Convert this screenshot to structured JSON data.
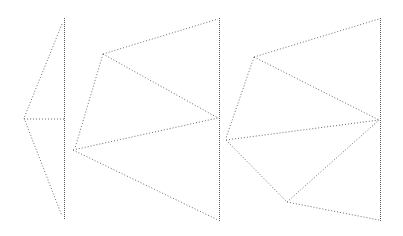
{
  "diagram": {
    "type": "dotted-line-geometric-figure",
    "stroke_color": "#6b6b6b",
    "background": "#ffffff",
    "vertical_lines": [
      {
        "id": "v1",
        "x": 64,
        "y1": 18,
        "y2": 220
      },
      {
        "id": "v2",
        "x": 219,
        "y1": 18,
        "y2": 222
      },
      {
        "id": "v3",
        "x": 380,
        "y1": 18,
        "y2": 222
      }
    ],
    "segments": [
      {
        "id": "s1",
        "x1": 62,
        "y1": 24,
        "x2": 24,
        "y2": 118
      },
      {
        "id": "s2",
        "x1": 24,
        "y1": 118,
        "x2": 62,
        "y2": 216
      },
      {
        "id": "s3",
        "x1": 24,
        "y1": 119,
        "x2": 64,
        "y2": 119
      },
      {
        "id": "s4",
        "x1": 103,
        "y1": 54,
        "x2": 218,
        "y2": 19
      },
      {
        "id": "s5",
        "x1": 103,
        "y1": 54,
        "x2": 218,
        "y2": 118
      },
      {
        "id": "s6",
        "x1": 103,
        "y1": 54,
        "x2": 75,
        "y2": 148
      },
      {
        "id": "s7",
        "x1": 73,
        "y1": 150,
        "x2": 218,
        "y2": 118
      },
      {
        "id": "s8",
        "x1": 73,
        "y1": 150,
        "x2": 218,
        "y2": 220
      },
      {
        "id": "s9",
        "x1": 254,
        "y1": 57,
        "x2": 379,
        "y2": 19
      },
      {
        "id": "s10",
        "x1": 254,
        "y1": 57,
        "x2": 379,
        "y2": 120
      },
      {
        "id": "s11",
        "x1": 254,
        "y1": 57,
        "x2": 226,
        "y2": 138
      },
      {
        "id": "s12",
        "x1": 226,
        "y1": 140,
        "x2": 379,
        "y2": 120
      },
      {
        "id": "s13",
        "x1": 226,
        "y1": 140,
        "x2": 287,
        "y2": 202
      },
      {
        "id": "s14",
        "x1": 287,
        "y1": 202,
        "x2": 379,
        "y2": 120
      },
      {
        "id": "s15",
        "x1": 287,
        "y1": 202,
        "x2": 379,
        "y2": 220
      }
    ]
  }
}
